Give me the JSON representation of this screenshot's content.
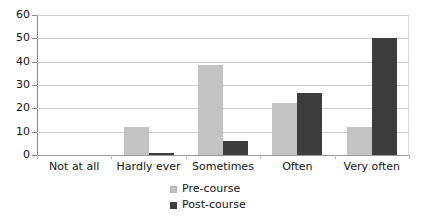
{
  "chart_data": {
    "type": "bar",
    "title": "",
    "xlabel": "",
    "ylabel": "",
    "categories": [
      "Not at all",
      "Hardly ever",
      "Sometimes",
      "Often",
      "Very often"
    ],
    "series": [
      {
        "name": "Pre-course",
        "color": "#c3c3c3",
        "values": [
          0,
          12,
          38.5,
          22.5,
          12
        ]
      },
      {
        "name": "Post-course",
        "color": "#3d3d3d",
        "values": [
          0,
          1,
          6,
          26.5,
          50
        ]
      }
    ],
    "ylim": [
      0,
      60
    ],
    "yticks": [
      0,
      10,
      20,
      30,
      40,
      50,
      60
    ],
    "ytick_labels": [
      "0",
      "10",
      "20",
      "30",
      "40",
      "50",
      "60"
    ],
    "grid": true,
    "grid_axis": "y",
    "legend": [
      "Pre-course",
      "Post-course"
    ],
    "legend_position": "bottom-center"
  }
}
